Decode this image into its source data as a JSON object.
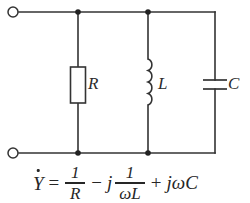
{
  "diagram": {
    "type": "circuit-schematic",
    "line_color": "#333333",
    "text_color": "#262626",
    "background": "#ffffff",
    "components": [
      {
        "id": "resistor",
        "label": "R",
        "symbol": "rectangle-box",
        "orientation": "vertical"
      },
      {
        "id": "inductor",
        "label": "L",
        "symbol": "coil",
        "coil_turns": 4,
        "orientation": "vertical"
      },
      {
        "id": "capacitor",
        "label": "C",
        "symbol": "parallel-plates",
        "orientation": "vertical"
      }
    ],
    "terminals": [
      {
        "id": "terminal-top-left",
        "shape": "open-circle"
      },
      {
        "id": "terminal-bottom-left",
        "shape": "open-circle"
      }
    ],
    "nodes": [
      {
        "id": "node-top-r",
        "x": 78,
        "y": 12
      },
      {
        "id": "node-top-l",
        "x": 148,
        "y": 12
      },
      {
        "id": "node-bottom-r",
        "x": 78,
        "y": 153
      },
      {
        "id": "node-bottom-l",
        "x": 148,
        "y": 153
      }
    ]
  },
  "formula": {
    "lhs": "Y",
    "lhs_accent": "dot",
    "equals": "=",
    "term1": {
      "numerator": "1",
      "denominator": "R"
    },
    "op1": "−",
    "j1": "j",
    "term2": {
      "numerator": "1",
      "denominator": "ωL"
    },
    "op2": "+",
    "term3": "jωC",
    "full_text": "Ẏ = 1/R − j 1/ωL + jωC"
  }
}
